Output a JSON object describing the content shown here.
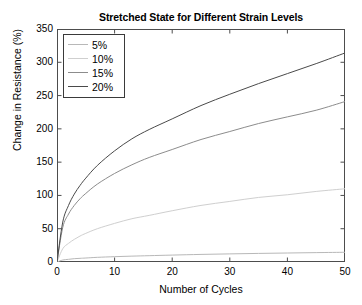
{
  "chart_data": {
    "type": "line",
    "title": "Stretched State for Different Strain Levels",
    "xlabel": "Number of Cycles",
    "ylabel": "Change in Resistance (%)",
    "xlim": [
      0,
      50
    ],
    "ylim": [
      0,
      350
    ],
    "xticks": [
      0,
      10,
      20,
      30,
      40,
      50
    ],
    "yticks": [
      0,
      50,
      100,
      150,
      200,
      250,
      300,
      350
    ],
    "grid": false,
    "legend_position": "top-left",
    "x": [
      0,
      1,
      2,
      3,
      4,
      5,
      7,
      10,
      13,
      16,
      20,
      25,
      30,
      35,
      40,
      45,
      50
    ],
    "series": [
      {
        "name": "5%",
        "color": "#b8b8b8",
        "values": [
          0,
          3,
          4,
          5,
          5.5,
          6,
          7,
          8,
          8.8,
          9.5,
          10.4,
          11.4,
          12.2,
          12.9,
          13.5,
          14.1,
          14.6
        ]
      },
      {
        "name": "10%",
        "color": "#cfcfcf",
        "values": [
          0,
          20,
          28,
          34,
          39,
          43,
          50,
          58,
          65,
          70,
          77,
          85,
          91,
          97,
          101,
          106,
          110
        ]
      },
      {
        "name": "15%",
        "color": "#8c8c8c",
        "values": [
          0,
          52,
          72,
          85,
          95,
          103,
          117,
          133,
          146,
          157,
          169,
          184,
          196,
          208,
          218,
          228,
          241
        ]
      },
      {
        "name": "20%",
        "color": "#4a4a4a",
        "values": [
          0,
          60,
          85,
          102,
          115,
          126,
          145,
          167,
          185,
          199,
          215,
          235,
          252,
          268,
          283,
          298,
          314
        ]
      }
    ]
  },
  "legend": {
    "items": [
      {
        "label": "5%"
      },
      {
        "label": "10%"
      },
      {
        "label": "15%"
      },
      {
        "label": "20%"
      }
    ]
  }
}
